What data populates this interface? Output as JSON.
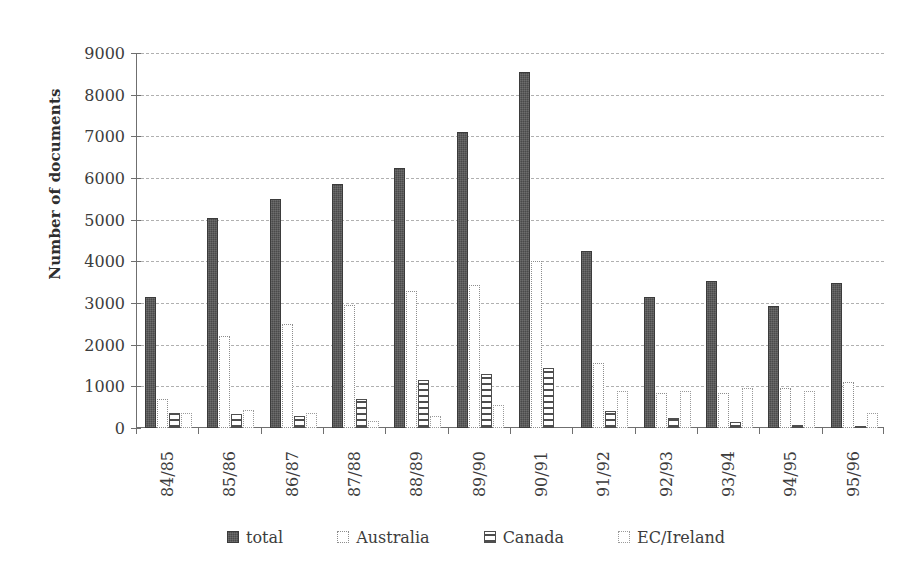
{
  "chart_data": {
    "type": "bar",
    "title": "",
    "xlabel": "",
    "ylabel": "Number of documents",
    "ylim": [
      0,
      9000
    ],
    "ytick_step": 1000,
    "yticks": [
      "9000",
      "8000",
      "7000",
      "6000",
      "5000",
      "4000",
      "3000",
      "2000",
      "1000",
      "0"
    ],
    "grid": true,
    "grid_axis": "y",
    "legend_position": "bottom",
    "categories": [
      "84/85",
      "85/86",
      "86/87",
      "87/88",
      "88/89",
      "89/90",
      "90/91",
      "91/92",
      "92/93",
      "93/94",
      "94/95",
      "95/96"
    ],
    "series": [
      {
        "name": "total",
        "pattern": "solid-dark",
        "color": "#4a4a4a",
        "values": [
          3150,
          5030,
          5500,
          5850,
          6250,
          7100,
          8550,
          4250,
          3150,
          3530,
          2930,
          3470
        ]
      },
      {
        "name": "Australia",
        "pattern": "dotted-outline",
        "color": "#ffffff",
        "values": [
          700,
          2200,
          2500,
          2950,
          3300,
          3430,
          4020,
          1550,
          850,
          850,
          950,
          1100
        ]
      },
      {
        "name": "Canada",
        "pattern": "horizontal-lines",
        "color": "#4e4e4e",
        "values": [
          350,
          330,
          300,
          700,
          1150,
          1300,
          1430,
          400,
          250,
          150,
          80,
          30
        ]
      },
      {
        "name": "EC/Ireland",
        "pattern": "white-outline",
        "color": "#ffffff",
        "values": [
          370,
          430,
          350,
          180,
          300,
          550,
          0,
          900,
          900,
          950,
          900,
          350
        ]
      }
    ]
  },
  "legend": {
    "items": [
      {
        "label": "total",
        "swatch": "solid-dark-swatch"
      },
      {
        "label": "Australia",
        "swatch": "dotted-outline-swatch"
      },
      {
        "label": "Canada",
        "swatch": "horizontal-lines-swatch"
      },
      {
        "label": "EC/Ireland",
        "swatch": "white-outline-swatch"
      }
    ]
  }
}
